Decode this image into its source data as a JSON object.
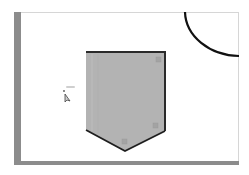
{
  "canvas": {
    "background": "#ffffff",
    "shadow_color": "#8c8c8c"
  },
  "shapes": [
    {
      "type": "pentagon",
      "name": "shield-shape",
      "fill": "#b3b3b3",
      "stroke": "#2a2a2a",
      "selected": true,
      "points": [
        [
          86,
          52
        ],
        [
          165,
          52
        ],
        [
          165,
          131
        ],
        [
          125,
          151
        ],
        [
          86,
          130
        ]
      ]
    },
    {
      "type": "arc",
      "name": "quarter-circle-arc",
      "stroke": "#111111"
    }
  ],
  "cursor": {
    "icon": "arrow-pointer-icon",
    "x": 67,
    "y": 95
  }
}
